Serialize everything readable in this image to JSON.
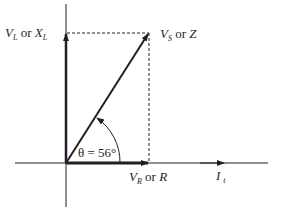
{
  "diagram": {
    "type": "phasor-diagram",
    "labels": {
      "vertical_main": "V",
      "vertical_main_sub": "L",
      "vertical_or": " or ",
      "vertical_alt": "X",
      "vertical_alt_sub": "L",
      "resultant_main": "V",
      "resultant_main_sub": "S",
      "resultant_or": " or ",
      "resultant_alt": "Z",
      "horizontal_main": "V",
      "horizontal_main_sub": "R",
      "horizontal_or": " or ",
      "horizontal_alt": "R",
      "current": "I",
      "current_sub": "t",
      "angle": "θ = 56°"
    },
    "angle_degrees": 56,
    "colors": {
      "line": "#231f20",
      "background": "#ffffff"
    }
  }
}
